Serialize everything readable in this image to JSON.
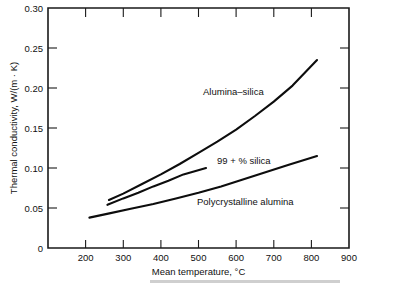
{
  "chart_data": {
    "type": "line",
    "title": "",
    "xlabel": "Mean temperature, °C",
    "ylabel": "Thermal conductivity, W/(m · K)",
    "xlim": [
      100,
      900
    ],
    "ylim": [
      0,
      0.3
    ],
    "grid": false,
    "legend_position": "inline-labels",
    "xticks": [
      100,
      200,
      300,
      400,
      500,
      600,
      700,
      800,
      900
    ],
    "xticklabels": [
      "",
      "200",
      "300",
      "400",
      "500",
      "600",
      "700",
      "800",
      "900"
    ],
    "yticks": [
      0,
      0.05,
      0.1,
      0.15,
      0.2,
      0.25,
      0.3
    ],
    "yticklabels": [
      "0",
      "0.05",
      "0.10",
      "0.15",
      "0.20",
      "0.25",
      "0.30"
    ],
    "series": [
      {
        "name": "Alumina–silica",
        "label": "Alumina–silica",
        "x": [
          262,
          300,
          350,
          400,
          450,
          500,
          550,
          600,
          650,
          700,
          750,
          815
        ],
        "y": [
          0.06,
          0.068,
          0.08,
          0.092,
          0.105,
          0.119,
          0.133,
          0.148,
          0.165,
          0.183,
          0.203,
          0.235
        ]
      },
      {
        "name": "99 + % silica",
        "label": "99 + % silica",
        "x": [
          258,
          300,
          340,
          380,
          420,
          460,
          490,
          520
        ],
        "y": [
          0.054,
          0.062,
          0.069,
          0.077,
          0.084,
          0.092,
          0.096,
          0.1
        ]
      },
      {
        "name": "Polycrystalline alumina",
        "label": "Polycrystalline alumina",
        "x": [
          210,
          260,
          320,
          380,
          440,
          500,
          560,
          620,
          680,
          740,
          815
        ],
        "y": [
          0.038,
          0.043,
          0.049,
          0.055,
          0.062,
          0.069,
          0.077,
          0.086,
          0.095,
          0.104,
          0.115
        ]
      }
    ],
    "annotations": [
      {
        "text": "Alumina–silica",
        "x": 380,
        "y": 0.192
      },
      {
        "text": "99 + % silica",
        "x": 385,
        "y": 0.112
      },
      {
        "text": "Polycrystalline alumina",
        "x": 430,
        "y": 0.07
      }
    ]
  }
}
